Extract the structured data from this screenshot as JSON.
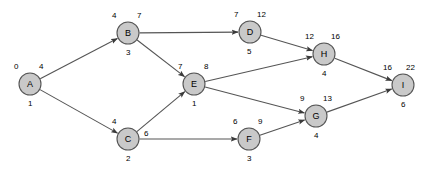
{
  "diagram": {
    "type": "directed-graph",
    "title": "",
    "background_color": "#ffffff",
    "node_fill_color": "#c9c9c9",
    "node_stroke_color": "#555555",
    "edge_color": "#555555",
    "nodes": [
      {
        "id": "A",
        "label": "A",
        "cx": 30,
        "cy": 84,
        "r": 11,
        "earliest": "0",
        "latest": "4",
        "duration": "1"
      },
      {
        "id": "B",
        "label": "B",
        "cx": 128,
        "cy": 33,
        "r": 11,
        "earliest": "4",
        "latest": "7",
        "duration": "3"
      },
      {
        "id": "C",
        "label": "C",
        "cx": 128,
        "cy": 139,
        "r": 11,
        "earliest": "4",
        "latest": "6",
        "duration": "2"
      },
      {
        "id": "D",
        "label": "D",
        "cx": 250,
        "cy": 32,
        "r": 11,
        "earliest": "7",
        "latest": "12",
        "duration": "5"
      },
      {
        "id": "E",
        "label": "E",
        "cx": 194,
        "cy": 84,
        "r": 11,
        "earliest": "7",
        "latest": "8",
        "duration": "1"
      },
      {
        "id": "F",
        "label": "F",
        "cx": 249,
        "cy": 139,
        "r": 11,
        "earliest": "6",
        "latest": "9",
        "duration": "3"
      },
      {
        "id": "G",
        "label": "G",
        "cx": 316,
        "cy": 116,
        "r": 11,
        "earliest": "9",
        "latest": "13",
        "duration": "4"
      },
      {
        "id": "H",
        "label": "H",
        "cx": 324,
        "cy": 54,
        "r": 11,
        "earliest": "12",
        "latest": "16",
        "duration": "4"
      },
      {
        "id": "I",
        "label": "I",
        "cx": 403,
        "cy": 85,
        "r": 11,
        "earliest": "16",
        "latest": "22",
        "duration": "6"
      }
    ],
    "edges": [
      {
        "from": "A",
        "to": "B"
      },
      {
        "from": "A",
        "to": "C"
      },
      {
        "from": "B",
        "to": "D"
      },
      {
        "from": "B",
        "to": "E"
      },
      {
        "from": "C",
        "to": "E"
      },
      {
        "from": "C",
        "to": "F"
      },
      {
        "from": "D",
        "to": "H"
      },
      {
        "from": "E",
        "to": "H"
      },
      {
        "from": "E",
        "to": "G"
      },
      {
        "from": "F",
        "to": "G"
      },
      {
        "from": "G",
        "to": "I"
      },
      {
        "from": "H",
        "to": "I"
      }
    ],
    "labels": [
      {
        "name": "node-a-earliest",
        "text": "0",
        "x": 14,
        "y": 62
      },
      {
        "name": "node-a-latest",
        "text": "4",
        "x": 39,
        "y": 62
      },
      {
        "name": "node-a-duration",
        "text": "1",
        "x": 28,
        "y": 99
      },
      {
        "name": "node-b-earliest",
        "text": "4",
        "x": 112,
        "y": 11
      },
      {
        "name": "node-b-latest",
        "text": "7",
        "x": 137,
        "y": 11
      },
      {
        "name": "node-b-duration",
        "text": "3",
        "x": 126,
        "y": 48
      },
      {
        "name": "node-c-earliest",
        "text": "4",
        "x": 112,
        "y": 117
      },
      {
        "name": "node-c-latest",
        "text": "6",
        "x": 144,
        "y": 129
      },
      {
        "name": "node-c-duration",
        "text": "2",
        "x": 126,
        "y": 154
      },
      {
        "name": "node-d-earliest",
        "text": "7",
        "x": 234,
        "y": 10
      },
      {
        "name": "node-d-latest",
        "text": "12",
        "x": 257,
        "y": 10
      },
      {
        "name": "node-d-duration",
        "text": "5",
        "x": 247,
        "y": 47
      },
      {
        "name": "node-e-earliest",
        "text": "7",
        "x": 178,
        "y": 62
      },
      {
        "name": "node-e-latest",
        "text": "8",
        "x": 204,
        "y": 62
      },
      {
        "name": "node-e-duration",
        "text": "1",
        "x": 192,
        "y": 99
      },
      {
        "name": "node-f-earliest",
        "text": "6",
        "x": 233,
        "y": 117
      },
      {
        "name": "node-f-latest",
        "text": "9",
        "x": 258,
        "y": 117
      },
      {
        "name": "node-f-duration",
        "text": "3",
        "x": 247,
        "y": 154
      },
      {
        "name": "node-g-earliest",
        "text": "9",
        "x": 300,
        "y": 94
      },
      {
        "name": "node-g-latest",
        "text": "13",
        "x": 323,
        "y": 94
      },
      {
        "name": "node-g-duration",
        "text": "4",
        "x": 314,
        "y": 131
      },
      {
        "name": "node-h-earliest",
        "text": "12",
        "x": 305,
        "y": 32
      },
      {
        "name": "node-h-latest",
        "text": "16",
        "x": 331,
        "y": 32
      },
      {
        "name": "node-h-duration",
        "text": "4",
        "x": 322,
        "y": 69
      },
      {
        "name": "node-i-earliest",
        "text": "16",
        "x": 383,
        "y": 63
      },
      {
        "name": "node-i-latest",
        "text": "22",
        "x": 406,
        "y": 63
      },
      {
        "name": "node-i-duration",
        "text": "6",
        "x": 401,
        "y": 100
      }
    ]
  }
}
